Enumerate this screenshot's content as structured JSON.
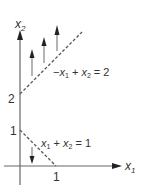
{
  "diagram": {
    "axes": {
      "x_label": "x",
      "x_sub": "1",
      "y_label": "x",
      "y_sub": "2"
    },
    "ticks": {
      "y_two": "2",
      "y_one": "1",
      "x_one": "1"
    },
    "constraints": [
      {
        "eq_parts": {
          "neg": "−",
          "a": "x",
          "a_sub": "1",
          "plus": " + ",
          "b": "x",
          "b_sub": "2",
          "rhs": " = 2"
        },
        "direction": "up",
        "arrow_count": 3
      },
      {
        "eq_parts": {
          "a": "x",
          "a_sub": "1",
          "plus": " + ",
          "b": "x",
          "b_sub": "2",
          "rhs": " = 1"
        },
        "direction": "down",
        "arrow_count": 1
      }
    ],
    "colors": {
      "line": "#555555",
      "text": "#333333"
    }
  }
}
